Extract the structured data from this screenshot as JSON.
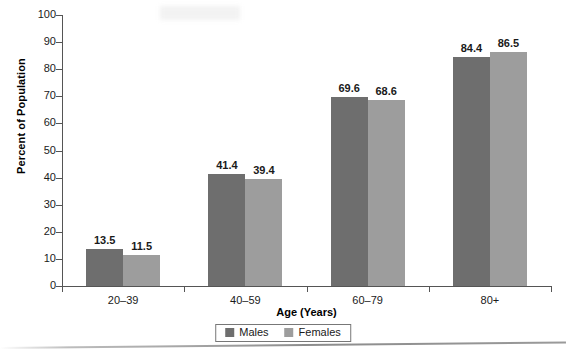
{
  "chart_data": {
    "type": "bar",
    "title": "",
    "xlabel": "Age (Years)",
    "ylabel": "Percent of Population",
    "categories": [
      "20–39",
      "40–59",
      "60–79",
      "80+"
    ],
    "series": [
      {
        "name": "Males",
        "color": "#6e6e6e",
        "values": [
          13.5,
          41.4,
          69.6,
          84.4
        ]
      },
      {
        "name": "Females",
        "color": "#9d9d9d",
        "values": [
          11.5,
          39.4,
          68.6,
          86.5
        ]
      }
    ],
    "ylim": [
      0,
      100
    ],
    "ytick_step": 10,
    "yticks": [
      "100",
      "90",
      "80",
      "70",
      "60",
      "50",
      "40",
      "30",
      "20",
      "10",
      "0"
    ],
    "grid": false,
    "legend_position": "bottom-center",
    "value_labels": {
      "males": [
        "13.5",
        "41.4",
        "69.6",
        "84.4"
      ],
      "females": [
        "11.5",
        "39.4",
        "68.6",
        "86.5"
      ]
    }
  },
  "legend": {
    "items": [
      {
        "label": "Males",
        "color": "#6e6e6e"
      },
      {
        "label": "Females",
        "color": "#9d9d9d"
      }
    ]
  },
  "axes": {
    "y_title": "Percent of Population",
    "x_title": "Age (Years)"
  }
}
